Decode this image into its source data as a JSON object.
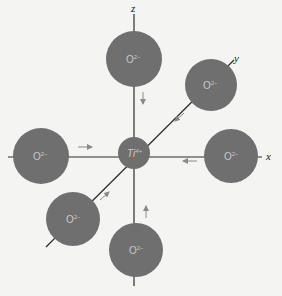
{
  "diagram": {
    "type": "octahedral-coordination",
    "colors": {
      "background": "#f4f4f2",
      "ion_fill": "#6f6f6f",
      "axis_line": "#2a2a2a",
      "arrow": "#8a8a8a",
      "label": "#c9c9c9"
    },
    "axes": [
      {
        "id": "z",
        "label": "z"
      },
      {
        "id": "x",
        "label": "x"
      },
      {
        "id": "y",
        "label": "y"
      }
    ],
    "central_ion": {
      "symbol": "Ti",
      "charge": "4+"
    },
    "ligands": [
      {
        "position": "top",
        "symbol": "O",
        "charge": "2−"
      },
      {
        "position": "upper-right",
        "symbol": "O",
        "charge": "2−"
      },
      {
        "position": "left",
        "symbol": "O",
        "charge": "2−"
      },
      {
        "position": "right",
        "symbol": "O",
        "charge": "2−"
      },
      {
        "position": "lower-left",
        "symbol": "O",
        "charge": "2−"
      },
      {
        "position": "bottom",
        "symbol": "O",
        "charge": "2−"
      }
    ]
  }
}
